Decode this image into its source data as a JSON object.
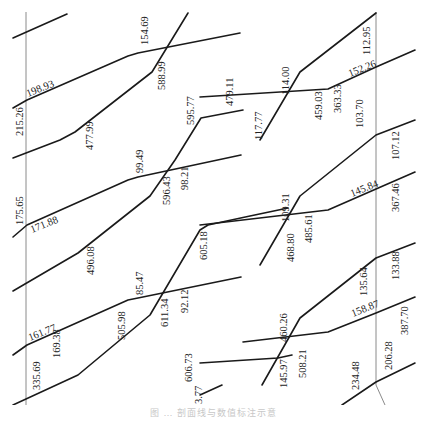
{
  "diagram": {
    "reference_lines": [
      {
        "id": "left-vertical",
        "points": [
          [
            26,
            12
          ],
          [
            26,
            405
          ]
        ]
      },
      {
        "id": "right-vertical",
        "points": [
          [
            376,
            12
          ],
          [
            376,
            385
          ],
          [
            385,
            405
          ]
        ]
      }
    ],
    "segments": [
      {
        "id": "s1",
        "points": [
          [
            13,
            38
          ],
          [
            67,
            14
          ]
        ]
      },
      {
        "id": "s2",
        "points": [
          [
            13,
            108
          ],
          [
            27,
            100
          ],
          [
            128,
            56
          ],
          [
            138,
            53
          ],
          [
            240,
            33
          ]
        ]
      },
      {
        "id": "s3",
        "points": [
          [
            13,
            158
          ],
          [
            60,
            140
          ],
          [
            75,
            132
          ],
          [
            152,
            72
          ],
          [
            188,
            13
          ]
        ]
      },
      {
        "id": "s4",
        "points": [
          [
            13,
            237
          ],
          [
            27,
            225
          ],
          [
            128,
            180
          ],
          [
            138,
            177
          ],
          [
            241,
            155
          ]
        ]
      },
      {
        "id": "s5",
        "points": [
          [
            13,
            291
          ],
          [
            78,
            253
          ],
          [
            150,
            196
          ],
          [
            175,
            160
          ],
          [
            201,
            118
          ],
          [
            243,
            110
          ]
        ]
      },
      {
        "id": "s6",
        "points": [
          [
            13,
            355
          ],
          [
            27,
            345
          ],
          [
            128,
            300
          ],
          [
            138,
            298
          ],
          [
            241,
            277
          ]
        ]
      },
      {
        "id": "s7",
        "points": [
          [
            13,
            405
          ],
          [
            78,
            375
          ],
          [
            150,
            315
          ],
          [
            200,
            230
          ],
          [
            208,
            225
          ],
          [
            250,
            216
          ],
          [
            288,
            208
          ]
        ]
      },
      {
        "id": "s8",
        "points": [
          [
            200,
            363
          ],
          [
            278,
            358
          ],
          [
            292,
            355
          ]
        ]
      },
      {
        "id": "s9",
        "points": [
          [
            260,
            140
          ],
          [
            300,
            72
          ],
          [
            376,
            13
          ]
        ]
      },
      {
        "id": "s10",
        "points": [
          [
            200,
            97
          ],
          [
            328,
            89
          ],
          [
            376,
            67
          ],
          [
            415,
            50
          ]
        ]
      },
      {
        "id": "s11",
        "points": [
          [
            260,
            265
          ],
          [
            300,
            196
          ],
          [
            376,
            135
          ],
          [
            415,
            120
          ]
        ]
      },
      {
        "id": "s12",
        "points": [
          [
            200,
            225
          ],
          [
            328,
            210
          ],
          [
            376,
            189
          ],
          [
            415,
            172
          ]
        ]
      },
      {
        "id": "s13",
        "points": [
          [
            200,
            395
          ],
          [
            222,
            385
          ]
        ]
      },
      {
        "id": "s14",
        "points": [
          [
            262,
            385
          ],
          [
            300,
            318
          ],
          [
            376,
            258
          ],
          [
            415,
            243
          ]
        ]
      },
      {
        "id": "s15",
        "points": [
          [
            243,
            342
          ],
          [
            328,
            332
          ],
          [
            376,
            313
          ],
          [
            415,
            297
          ]
        ]
      },
      {
        "id": "s16",
        "points": [
          [
            342,
            405
          ],
          [
            376,
            382
          ],
          [
            415,
            363
          ]
        ]
      }
    ],
    "labels": [
      {
        "text": "198.93",
        "x": 28,
        "y": 97,
        "rotate": -22
      },
      {
        "text": "215.26",
        "x": 23,
        "y": 136,
        "rotate": -90
      },
      {
        "text": "154.69",
        "x": 148,
        "y": 45,
        "rotate": -90
      },
      {
        "text": "588.99",
        "x": 165,
        "y": 90,
        "rotate": -90
      },
      {
        "text": "477.99",
        "x": 93,
        "y": 150,
        "rotate": -90
      },
      {
        "text": "595.77",
        "x": 194,
        "y": 125,
        "rotate": -90
      },
      {
        "text": "479.11",
        "x": 233,
        "y": 106,
        "rotate": -90
      },
      {
        "text": "117.77",
        "x": 262,
        "y": 140,
        "rotate": -90
      },
      {
        "text": "114.00",
        "x": 289,
        "y": 95,
        "rotate": -90
      },
      {
        "text": "459.03",
        "x": 322,
        "y": 120,
        "rotate": -90
      },
      {
        "text": "363.33",
        "x": 341,
        "y": 113,
        "rotate": -90
      },
      {
        "text": "152.26",
        "x": 350,
        "y": 77,
        "rotate": -22
      },
      {
        "text": "112.95",
        "x": 370,
        "y": 55,
        "rotate": -90
      },
      {
        "text": "175.65",
        "x": 23,
        "y": 225,
        "rotate": -90
      },
      {
        "text": "171.88",
        "x": 32,
        "y": 233,
        "rotate": -22
      },
      {
        "text": "99.49",
        "x": 143,
        "y": 173,
        "rotate": -90
      },
      {
        "text": "596.43",
        "x": 170,
        "y": 205,
        "rotate": -90
      },
      {
        "text": "98.21",
        "x": 188,
        "y": 190,
        "rotate": -90
      },
      {
        "text": "496.08",
        "x": 94,
        "y": 275,
        "rotate": -90
      },
      {
        "text": "605.18",
        "x": 207,
        "y": 260,
        "rotate": -90
      },
      {
        "text": "109.31",
        "x": 289,
        "y": 222,
        "rotate": -90
      },
      {
        "text": "468.80",
        "x": 294,
        "y": 262,
        "rotate": -90
      },
      {
        "text": "485.61",
        "x": 312,
        "y": 243,
        "rotate": -90
      },
      {
        "text": "145.84",
        "x": 352,
        "y": 197,
        "rotate": -22
      },
      {
        "text": "103.70",
        "x": 363,
        "y": 128,
        "rotate": -90
      },
      {
        "text": "107.12",
        "x": 399,
        "y": 160,
        "rotate": -90
      },
      {
        "text": "367.46",
        "x": 399,
        "y": 212,
        "rotate": -90
      },
      {
        "text": "161.77",
        "x": 30,
        "y": 341,
        "rotate": -22
      },
      {
        "text": "169.38",
        "x": 60,
        "y": 358,
        "rotate": -90
      },
      {
        "text": "335.69",
        "x": 40,
        "y": 390,
        "rotate": -90
      },
      {
        "text": "505.98",
        "x": 125,
        "y": 340,
        "rotate": -90
      },
      {
        "text": "85.47",
        "x": 143,
        "y": 295,
        "rotate": -90
      },
      {
        "text": "611.34",
        "x": 168,
        "y": 327,
        "rotate": -90
      },
      {
        "text": "92.12",
        "x": 188,
        "y": 313,
        "rotate": -90
      },
      {
        "text": "606.73",
        "x": 192,
        "y": 382,
        "rotate": -90
      },
      {
        "text": "3.77",
        "x": 202,
        "y": 404,
        "rotate": -90
      },
      {
        "text": "460.26",
        "x": 287,
        "y": 342,
        "rotate": -90
      },
      {
        "text": "145.97",
        "x": 287,
        "y": 388,
        "rotate": -90
      },
      {
        "text": "508.21",
        "x": 306,
        "y": 378,
        "rotate": -90
      },
      {
        "text": "135.64",
        "x": 367,
        "y": 296,
        "rotate": -90
      },
      {
        "text": "158.87",
        "x": 353,
        "y": 317,
        "rotate": -22
      },
      {
        "text": "133.88",
        "x": 399,
        "y": 280,
        "rotate": -90
      },
      {
        "text": "387.70",
        "x": 408,
        "y": 335,
        "rotate": -90
      },
      {
        "text": "234.48",
        "x": 359,
        "y": 390,
        "rotate": -90
      },
      {
        "text": "206.28",
        "x": 392,
        "y": 370,
        "rotate": -90
      }
    ]
  },
  "caption": "图 … 剖面线与数值标注示意"
}
